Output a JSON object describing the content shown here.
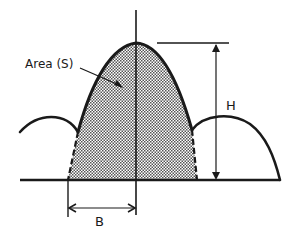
{
  "diagram": {
    "labels": {
      "area": "Area (S)",
      "height": "H",
      "half_base": "B"
    },
    "colors": {
      "stroke": "#1a1a1a",
      "fill_dots": "#555555",
      "background": "#ffffff"
    }
  }
}
